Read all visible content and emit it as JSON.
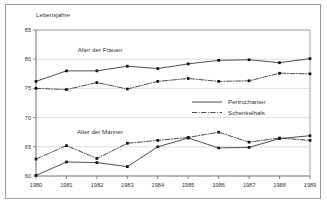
{
  "figure": {
    "y_axis_title": "Lebensjahre"
  },
  "annotations": [
    {
      "name": "women-group-label",
      "text": "Alter der Frauen"
    },
    {
      "name": "men-group-label",
      "text": "Alter der Männer"
    }
  ],
  "legend": {
    "position": "center-right",
    "entries": [
      {
        "label": "Pertrochanter",
        "style": "solid"
      },
      {
        "label": "Schenkelhals",
        "style": "dash-dot"
      }
    ]
  },
  "colors": {
    "line": "#3a3a3a",
    "marker": "#111111",
    "grid": "#d8d8d8",
    "axis": "#6e6e6e",
    "frame": "#9a9a9a",
    "text": "#333333",
    "background": "#ffffff"
  },
  "chart_data": {
    "type": "line",
    "title": "",
    "xlabel": "",
    "ylabel": "Lebensjahre",
    "xlim": [
      1980,
      1989
    ],
    "ylim": [
      60,
      85
    ],
    "yticks": [
      60,
      65,
      70,
      75,
      80,
      85
    ],
    "ytick_labels": [
      "60",
      "65",
      "70",
      "75",
      "80",
      "85"
    ],
    "grid": true,
    "x": [
      1980,
      1981,
      1982,
      1983,
      1984,
      1985,
      1986,
      1987,
      1988,
      1989
    ],
    "xtick_labels": [
      "1980",
      "1981",
      "1982",
      "1983",
      "1984",
      "1985",
      "1986",
      "1987",
      "1988",
      "1989"
    ],
    "series": [
      {
        "name": "Pertrochanter",
        "group": "Alter der Frauen",
        "style": "solid",
        "values": [
          76.2,
          78.0,
          78.0,
          78.8,
          78.4,
          79.2,
          79.8,
          79.9,
          79.4,
          80.1
        ]
      },
      {
        "name": "Schenkelhals",
        "group": "Alter der Frauen",
        "style": "dash-dot",
        "values": [
          75.0,
          74.8,
          76.0,
          74.9,
          76.2,
          76.7,
          76.2,
          76.3,
          77.6,
          77.5
        ]
      },
      {
        "name": "Pertrochanter",
        "group": "Alter der Männer",
        "style": "solid",
        "values": [
          60.1,
          62.4,
          62.3,
          61.6,
          65.0,
          66.5,
          64.8,
          64.9,
          66.4,
          66.9
        ]
      },
      {
        "name": "Schenkelhals",
        "group": "Alter der Männer",
        "style": "dash-dot",
        "values": [
          62.9,
          65.2,
          63.0,
          65.6,
          66.1,
          66.6,
          67.5,
          65.8,
          66.5,
          66.1
        ]
      }
    ]
  }
}
